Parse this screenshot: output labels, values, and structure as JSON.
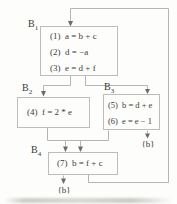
{
  "figure": {
    "type": "control-flow-graph",
    "background_color": "#fdfdfb",
    "line_color": "#b5b5b3",
    "arrow_color": "#6b6b6b",
    "text_color": "#3a3a3a"
  },
  "blocks": [
    {
      "label_base": "B",
      "label_sub": "1",
      "statements": [
        {
          "num": "(1)",
          "code": "a = b + c"
        },
        {
          "num": "(2)",
          "code": "d = −a"
        },
        {
          "num": "(3)",
          "code": "e = d + f"
        }
      ]
    },
    {
      "label_base": "B",
      "label_sub": "2",
      "statements": [
        {
          "num": "(4)",
          "code": "f = 2 * e"
        }
      ]
    },
    {
      "label_base": "B",
      "label_sub": "3",
      "statements": [
        {
          "num": "(5)",
          "code": "b = d + e"
        },
        {
          "num": "(6)",
          "code": "e = e − 1"
        }
      ]
    },
    {
      "label_base": "B",
      "label_sub": "4",
      "statements": [
        {
          "num": "(7)",
          "code": "b = f + c"
        }
      ]
    }
  ],
  "annotations": {
    "b3_exit": "{b}",
    "b4_exit": "{b}"
  },
  "edges": [
    {
      "from": "B1",
      "to": "B2"
    },
    {
      "from": "B1",
      "to": "B3"
    },
    {
      "from": "B2",
      "to": "B4"
    },
    {
      "from": "B3",
      "to": "B4"
    },
    {
      "from": "B3",
      "to": "exit-b"
    },
    {
      "from": "B4",
      "to": "exit-b"
    },
    {
      "from": "B4",
      "to": "B1"
    }
  ]
}
